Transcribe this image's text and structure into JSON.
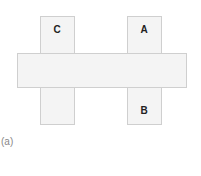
{
  "diagram": {
    "labels": {
      "top_left": "C",
      "top_right": "A",
      "bottom_right": "B"
    },
    "caption": "(a)",
    "colors": {
      "fill": "#f4f4f4",
      "border": "#cfcfcf",
      "text": "#222222"
    }
  }
}
